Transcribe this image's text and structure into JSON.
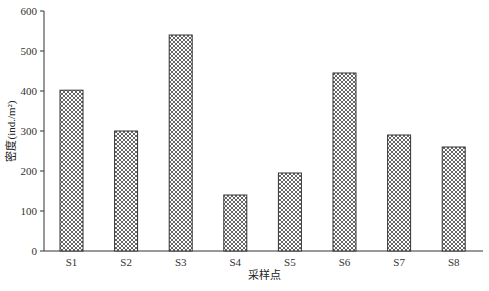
{
  "chart_data": {
    "type": "bar",
    "title": "",
    "xlabel": "采样点",
    "ylabel": "密度(ind./m²)",
    "categories": [
      "S1",
      "S2",
      "S3",
      "S4",
      "S5",
      "S6",
      "S7",
      "S8"
    ],
    "values": [
      402,
      300,
      540,
      140,
      195,
      445,
      290,
      260
    ],
    "ylim": [
      0,
      600
    ],
    "yticks": [
      0,
      100,
      200,
      300,
      400,
      500,
      600
    ],
    "grid": false,
    "legend": null,
    "bar_fill": "crosshatch",
    "colors": {
      "bar_edge": "#333333",
      "hatch": "#555555",
      "axis": "#333333"
    }
  }
}
